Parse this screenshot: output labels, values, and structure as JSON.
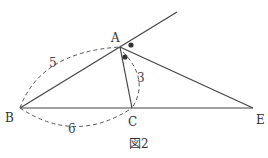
{
  "figure": {
    "caption": "図2",
    "points": {
      "A": {
        "label": "A",
        "x": 120,
        "y": 47
      },
      "B": {
        "label": "B",
        "x": 20,
        "y": 108
      },
      "C": {
        "label": "C",
        "x": 132,
        "y": 108
      },
      "E": {
        "label": "E",
        "x": 253,
        "y": 108
      }
    },
    "lengths": {
      "AB": "5",
      "AC": "3",
      "BC": "6"
    },
    "colors": {
      "line": "#444444",
      "dash": "#555555",
      "mark": "#333333"
    }
  }
}
